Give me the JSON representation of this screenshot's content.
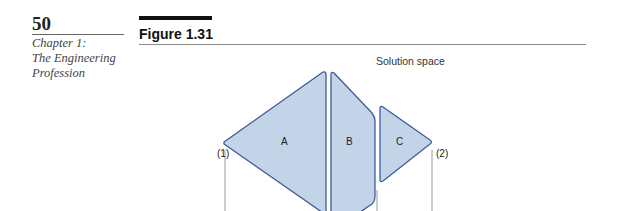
{
  "page": {
    "number": "50",
    "chapter_lines": [
      "Chapter 1:",
      "The Engineering",
      "Profession"
    ]
  },
  "figure": {
    "title": "Figure 1.31",
    "space_label": "Solution space",
    "regions": [
      "A",
      "B",
      "C"
    ],
    "points": [
      "(1)",
      "(2)"
    ],
    "colors": {
      "fill": "#c3d3e8",
      "stroke": "#3f5c9a",
      "line": "#999999"
    }
  }
}
